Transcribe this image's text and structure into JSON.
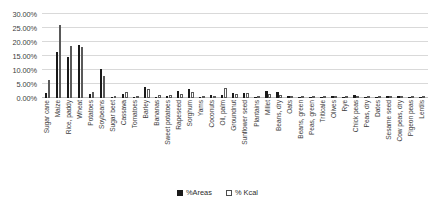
{
  "chart_data": {
    "type": "bar",
    "title": "",
    "xlabel": "",
    "ylabel": "",
    "ylim": [
      0,
      30
    ],
    "ytick_labels": [
      "30.00%",
      "25.00%",
      "20.00%",
      "15.00%",
      "10.00%",
      "5.00%",
      "0.00%"
    ],
    "ytick_values": [
      30,
      25,
      20,
      15,
      10,
      5,
      0
    ],
    "grid": true,
    "legend_position": "bottom",
    "categories": [
      "Sugar cane",
      "Maize",
      "Rice, paddy",
      "Wheat",
      "Potatoes",
      "Soybeans",
      "Sugar beet",
      "Cassava",
      "Tomatoes",
      "Barley",
      "Bananas",
      "Sweet potatoes",
      "Rapeseed",
      "Sorghum",
      "Yams",
      "Coconuts",
      "Oil, palm",
      "Groundnut",
      "Sunflower seed",
      "Plantains",
      "Millet",
      "Beans, dry",
      "Oats",
      "Beans, green",
      "Peas, green",
      "Triticale",
      "Olives",
      "Rye",
      "Chick peas",
      "Peas, dry",
      "Dates",
      "Sesame seed",
      "Cow peas, dry",
      "Pigeon peas",
      "Lentils"
    ],
    "series": [
      {
        "name": "%Areas",
        "color": "#1a1a1a",
        "values": [
          1.7,
          16.3,
          14.5,
          19.1,
          1.3,
          10.5,
          0.3,
          1.6,
          0.3,
          4.0,
          0.4,
          0.6,
          2.4,
          3.2,
          0.4,
          0.9,
          1.1,
          1.8,
          1.8,
          0.4,
          2.4,
          2.0,
          0.7,
          0.1,
          0.1,
          0.3,
          0.8,
          0.4,
          0.9,
          0.5,
          0.1,
          0.7,
          0.8,
          0.4,
          0.3
        ]
      },
      {
        "name": "% Kcal",
        "color": "#ffffff",
        "values": [
          6.5,
          26.1,
          18.6,
          18.3,
          2.0,
          8.0,
          0.6,
          2.3,
          0.3,
          3.3,
          0.9,
          1.0,
          1.3,
          2.0,
          0.5,
          0.5,
          3.6,
          1.6,
          1.7,
          0.7,
          1.3,
          1.0,
          0.5,
          0.2,
          0.2,
          0.3,
          0.5,
          0.4,
          0.5,
          0.3,
          0.3,
          0.4,
          0.5,
          0.2,
          0.2
        ]
      }
    ]
  },
  "legend": {
    "entries": [
      {
        "label": "%Areas"
      },
      {
        "label": "% Kcal"
      }
    ]
  }
}
